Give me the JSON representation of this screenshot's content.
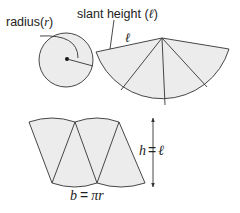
{
  "diagram": {
    "labels": {
      "radius_text": "radius(",
      "radius_var": "r",
      "radius_close": ")",
      "slant_text": "slant height (",
      "slant_var": "ℓ",
      "slant_close": ")",
      "sector_edge_var": "ℓ",
      "height_lhs": "h",
      "height_eq": "=",
      "height_rhs": "ℓ",
      "base_lhs": "b",
      "base_eq": "=",
      "base_rhs": "πr"
    },
    "colors": {
      "fill": "#ececec",
      "stroke": "#333333",
      "text": "#222222"
    }
  }
}
